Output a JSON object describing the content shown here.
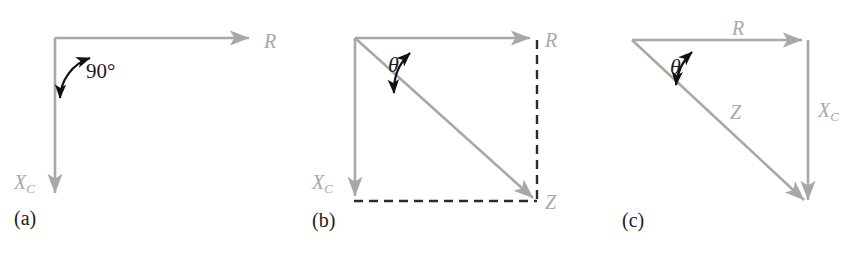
{
  "figure": {
    "background": "#ffffff",
    "vector_color": "#a8a8a8",
    "dash_color": "#2b2b2b",
    "arc_color": "#101010",
    "label_color": "#a8a8a8",
    "caption_color": "#1c1c1c",
    "width": 848,
    "height": 256
  },
  "panels": [
    {
      "id": "a",
      "caption": "(a)",
      "description": "Resistance R horizontal and capacitive reactance X_C vertical at 90 degrees",
      "labels": {
        "r": "R",
        "xc_base": "X",
        "xc_sub": "C",
        "angle": "90°"
      }
    },
    {
      "id": "b",
      "caption": "(b)",
      "description": "Impedance Z as diagonal of rectangle formed by R and X_C with angle theta",
      "labels": {
        "r": "R",
        "xc_base": "X",
        "xc_sub": "C",
        "z": "Z",
        "angle": "θ"
      }
    },
    {
      "id": "c",
      "caption": "(c)",
      "description": "Impedance triangle with R, X_C and hypotenuse Z and angle theta",
      "labels": {
        "r": "R",
        "xc_base": "X",
        "xc_sub": "C",
        "z": "Z",
        "angle": "θ"
      }
    }
  ]
}
